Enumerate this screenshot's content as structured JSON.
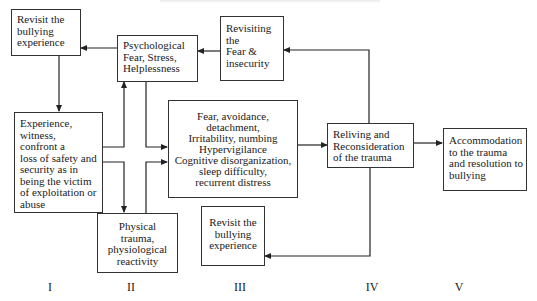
{
  "diagram": {
    "boxes": {
      "revisit_top": {
        "lines": [
          "Revisit the",
          "bullying",
          "experience"
        ]
      },
      "experience": {
        "lines": [
          "Experience,",
          "witness,",
          "confront a",
          "loss of safety and",
          "security as in",
          "being the victim",
          "of exploitation or",
          "abuse"
        ]
      },
      "psychological": {
        "lines": [
          "Psychological",
          "Fear, Stress,",
          "Helplessness"
        ]
      },
      "revisiting_fear": {
        "lines": [
          "Revisiting",
          "the",
          "Fear &",
          "insecurity"
        ]
      },
      "symptoms": {
        "lines": [
          "Fear, avoidance,",
          "detachment,",
          "Irritability, numbing",
          "Hypervigilance",
          "Cognitive disorganization,",
          "sleep difficulty,",
          "recurrent distress"
        ]
      },
      "physical": {
        "lines": [
          "Physical",
          "trauma,",
          "physiological",
          "reactivity"
        ]
      },
      "revisit_bottom": {
        "lines": [
          "Revisit the",
          "bullying",
          "experience"
        ]
      },
      "reliving": {
        "lines": [
          "Reliving and",
          "Reconsideration",
          "of the trauma"
        ]
      },
      "accommodation": {
        "lines": [
          "Accommodation",
          "to the trauma",
          "and resolution to",
          "bullying"
        ]
      }
    },
    "stages": [
      "I",
      "II",
      "III",
      "IV",
      "V"
    ],
    "connections": [
      {
        "from": "revisit_top",
        "to": "experience"
      },
      {
        "from": "experience",
        "to": "psychological"
      },
      {
        "from": "experience",
        "to": "physical"
      },
      {
        "from": "psychological",
        "to": "revisit_top"
      },
      {
        "from": "psychological",
        "to": "symptoms"
      },
      {
        "from": "physical",
        "to": "symptoms"
      },
      {
        "from": "revisiting_fear",
        "to": "psychological"
      },
      {
        "from": "symptoms",
        "to": "reliving"
      },
      {
        "from": "reliving",
        "to": "revisiting_fear"
      },
      {
        "from": "reliving",
        "to": "revisit_bottom"
      },
      {
        "from": "reliving",
        "to": "accommodation"
      }
    ],
    "colors": {
      "stroke": "#222222",
      "text": "#1a1a1a"
    }
  }
}
